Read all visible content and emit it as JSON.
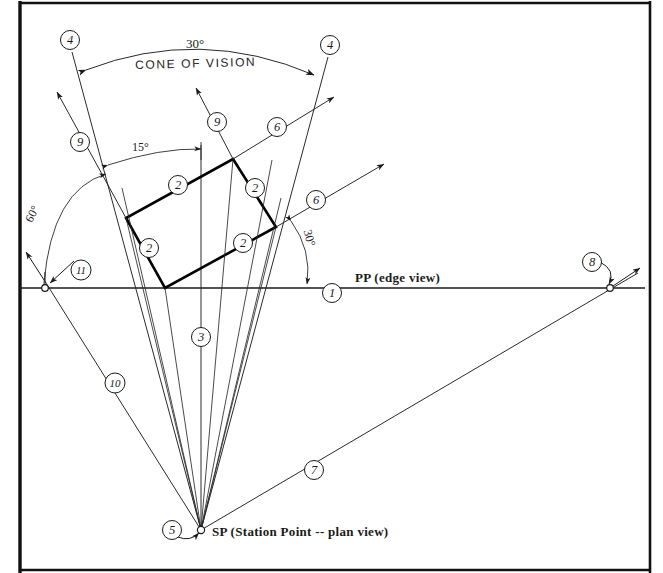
{
  "diagram": {
    "type": "technical-line-drawing",
    "frame": {
      "left": 20,
      "top": 2,
      "right": 650,
      "bottom": 571,
      "stroke": "#111111",
      "width": 3
    },
    "colors": {
      "ink": "#1a1a1a",
      "light_ink": "#3a3a3a",
      "heavy_ink": "#000000",
      "background": "#ffffff"
    },
    "labels": {
      "pp": "PP  (edge view)",
      "sp": "SP  (Station Point -- plan view)",
      "cone_of_vision": "CONE OF VISION"
    },
    "angles": {
      "cone": "30°",
      "object_rotation": "15°",
      "left_ray": "60°",
      "right_ray": "30°"
    },
    "key_points": {
      "station_point": {
        "x": 201,
        "y": 530
      },
      "picture_plane_y": 288,
      "center_axis_x": 201,
      "right_vp_on_pp": {
        "x": 610,
        "y": 288
      },
      "left_vp_on_pp": {
        "x": 45,
        "y": 288
      }
    },
    "object_plan": {
      "description": "rectangular object plan view",
      "corners": [
        {
          "x": 233,
          "y": 159
        },
        {
          "x": 276,
          "y": 227
        },
        {
          "x": 165,
          "y": 288
        },
        {
          "x": 126,
          "y": 218
        }
      ]
    },
    "callouts": [
      {
        "id": "1",
        "x": 332,
        "y": 293,
        "note": "picture plane line"
      },
      {
        "id": "2",
        "x": 178,
        "y": 185,
        "note": "object edge upper-left"
      },
      {
        "id": "2b",
        "x": 255,
        "y": 188,
        "note": "object edge upper-right"
      },
      {
        "id": "2c",
        "x": 149,
        "y": 248,
        "note": "object edge lower-left"
      },
      {
        "id": "2d",
        "x": 243,
        "y": 243,
        "note": "object edge lower-right"
      },
      {
        "id": "3",
        "x": 201,
        "y": 337,
        "note": "center visual ray"
      },
      {
        "id": "4",
        "x": 70,
        "y": 40,
        "note": "left cone of vision limit"
      },
      {
        "id": "4b",
        "x": 330,
        "y": 45,
        "note": "right cone of vision limit"
      },
      {
        "id": "5",
        "x": 172,
        "y": 530,
        "note": "station point"
      },
      {
        "id": "6",
        "x": 277,
        "y": 127,
        "note": "right-direction horizontal line"
      },
      {
        "id": "6b",
        "x": 316,
        "y": 200,
        "note": "right-direction horizontal line 2"
      },
      {
        "id": "7",
        "x": 314,
        "y": 470,
        "note": "ray to right vanishing point"
      },
      {
        "id": "8",
        "x": 592,
        "y": 262,
        "note": "right vanishing point on PP"
      },
      {
        "id": "9",
        "x": 217,
        "y": 122,
        "note": "left-direction line from object"
      },
      {
        "id": "9b",
        "x": 80,
        "y": 142,
        "note": "left-direction line 2"
      },
      {
        "id": "10",
        "x": 115,
        "y": 383,
        "note": "ray to left vanishing point"
      },
      {
        "id": "11",
        "x": 81,
        "y": 270,
        "note": "left vanishing point on PP"
      }
    ]
  }
}
